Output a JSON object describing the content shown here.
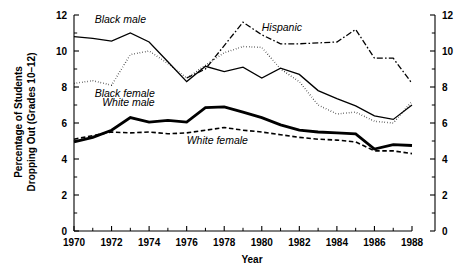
{
  "chart_data": {
    "type": "line",
    "title": "",
    "xlabel": "Year",
    "ylabel": "Percentage of Students Dropping Out (Grades 10–12)",
    "ylabel_line1": "Percentage of Students",
    "ylabel_line2": "Dropping Out (Grades 10–12)",
    "xlim": [
      1970,
      1988
    ],
    "ylim": [
      0,
      12
    ],
    "grid": false,
    "legend_position": "inline-annotations",
    "dual_y_axis": true,
    "x": [
      1970,
      1971,
      1972,
      1973,
      1974,
      1975,
      1976,
      1977,
      1978,
      1979,
      1980,
      1981,
      1982,
      1983,
      1984,
      1985,
      1986,
      1987,
      1988
    ],
    "x_tick_labels": [
      "1970",
      "1972",
      "1974",
      "1976",
      "1978",
      "1980",
      "1982",
      "1984",
      "1986",
      "1988"
    ],
    "x_tick_values": [
      1970,
      1972,
      1974,
      1976,
      1978,
      1980,
      1982,
      1984,
      1986,
      1988
    ],
    "x_minor_tick_values": [
      1971,
      1973,
      1975,
      1977,
      1979,
      1981,
      1983,
      1985,
      1987
    ],
    "y_tick_labels": [
      "0",
      "2",
      "4",
      "6",
      "8",
      "10",
      "12"
    ],
    "y_tick_values": [
      0,
      2,
      4,
      6,
      8,
      10,
      12
    ],
    "y_minor_tick_values": [
      1,
      3,
      5,
      7,
      9,
      11
    ],
    "y_tick_labels_right": [
      "0",
      "2",
      "4",
      "6",
      "8",
      "10",
      "12"
    ],
    "series": [
      {
        "name": "Black male",
        "label": "Black male",
        "style": "solid-thin",
        "stroke_width": 1.3,
        "dash": "none",
        "label_x": 1971.1,
        "label_y": 11.55,
        "values": [
          10.8,
          10.7,
          10.55,
          11.0,
          10.5,
          9.4,
          8.3,
          9.15,
          8.85,
          9.1,
          8.5,
          9.05,
          8.7,
          7.8,
          7.35,
          6.95,
          6.4,
          6.2,
          7.0
        ]
      },
      {
        "name": "Black female",
        "label": "Black female",
        "style": "dotted",
        "stroke_width": 1.5,
        "dash": "0.5,2.2",
        "label_x": 1971.1,
        "label_y": 7.45,
        "values": [
          8.2,
          8.35,
          8.1,
          9.8,
          10.0,
          9.3,
          8.5,
          9.2,
          9.9,
          10.25,
          10.2,
          9.0,
          8.3,
          7.0,
          6.5,
          6.6,
          6.1,
          6.0,
          7.2
        ]
      },
      {
        "name": "Hispanic",
        "label": "Hispanic",
        "style": "dash-dot",
        "stroke_width": 1.3,
        "dash": "6,2.2,1.6,2.2",
        "label_x": 1980.0,
        "label_y": 11.1,
        "start_year": 1976,
        "values": [
          null,
          null,
          null,
          null,
          null,
          null,
          8.5,
          9.0,
          10.3,
          11.6,
          10.9,
          10.4,
          10.4,
          10.45,
          10.5,
          11.2,
          9.6,
          9.6,
          8.2
        ]
      },
      {
        "name": "White male",
        "label": "White male",
        "style": "solid-thick",
        "stroke_width": 2.8,
        "dash": "none",
        "label_x": 1971.5,
        "label_y": 6.95,
        "values": [
          4.95,
          5.2,
          5.6,
          6.3,
          6.05,
          6.15,
          6.05,
          6.85,
          6.9,
          6.6,
          6.3,
          5.9,
          5.6,
          5.5,
          5.45,
          5.4,
          4.55,
          4.8,
          4.75
        ]
      },
      {
        "name": "White female",
        "label": "White female",
        "style": "dashed",
        "stroke_width": 1.6,
        "dash": "4.5,2.6",
        "label_x": 1976.0,
        "label_y": 4.85,
        "values": [
          5.1,
          5.3,
          5.5,
          5.45,
          5.5,
          5.4,
          5.45,
          5.6,
          5.75,
          5.6,
          5.5,
          5.35,
          5.2,
          5.1,
          5.05,
          4.95,
          4.45,
          4.45,
          4.3
        ]
      }
    ],
    "colors": {
      "line": "#000000",
      "axis": "#000000",
      "background": "#ffffff"
    }
  }
}
